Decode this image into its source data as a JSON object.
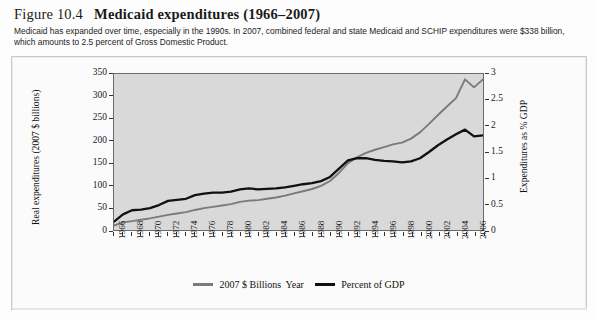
{
  "figure": {
    "number": "Figure 10.4",
    "title": "Medicaid expenditures (1966–2007)",
    "caption": "Medicaid has expanded over time, especially in the 1990s. In 2007, combined federal and state Medicaid and SCHIP expenditures were $338 billion, which amounts to 2.5 percent of Gross Domestic Product."
  },
  "colors": {
    "series_billions": "#7a7a7a",
    "series_gdp": "#111111",
    "plot_background": "#d9d9d9",
    "frame": "#6a6a6a",
    "page_background": "#fdfdfd"
  },
  "chart_data": {
    "type": "line",
    "title": "Medicaid expenditures (1966–2007)",
    "xlabel": "Year",
    "ylabel": "Real expenditures (2007 $ billions)",
    "y2label": "Expenditures as % GDP",
    "xlim": [
      1966,
      2007
    ],
    "ylim": [
      0,
      350
    ],
    "y2lim": [
      0,
      3
    ],
    "yticks": [
      0,
      50,
      100,
      150,
      200,
      250,
      300,
      350
    ],
    "y2ticks": [
      0,
      0.5,
      1,
      1.5,
      2,
      2.5,
      3
    ],
    "xticklabels": [
      "1966",
      "1968",
      "1970",
      "1972",
      "1974",
      "1976",
      "1978",
      "1980",
      "1982",
      "1984",
      "1986",
      "1988",
      "1990",
      "1992",
      "1994",
      "1996",
      "1998",
      "2000",
      "2002",
      "2004",
      "2006"
    ],
    "grid": false,
    "legend_position": "bottom-center",
    "x": [
      1966,
      1967,
      1968,
      1969,
      1970,
      1971,
      1972,
      1973,
      1974,
      1975,
      1976,
      1977,
      1978,
      1979,
      1980,
      1981,
      1982,
      1983,
      1984,
      1985,
      1986,
      1987,
      1988,
      1989,
      1990,
      1991,
      1992,
      1993,
      1994,
      1995,
      1996,
      1997,
      1998,
      1999,
      2000,
      2001,
      2002,
      2003,
      2004,
      2005,
      2006,
      2007
    ],
    "series": [
      {
        "name": "2007 $ Billions",
        "axis": "left",
        "color": "#7a7a7a",
        "values": [
          10,
          17,
          20,
          23,
          26,
          30,
          34,
          37,
          40,
          45,
          49,
          52,
          55,
          58,
          63,
          66,
          67,
          70,
          73,
          77,
          82,
          87,
          92,
          99,
          110,
          128,
          150,
          163,
          173,
          180,
          186,
          192,
          196,
          205,
          219,
          238,
          258,
          277,
          296,
          338,
          320,
          338
        ]
      },
      {
        "name": "Percent of GDP",
        "axis": "right",
        "color": "#111111",
        "values": [
          0.16,
          0.3,
          0.38,
          0.39,
          0.42,
          0.48,
          0.56,
          0.58,
          0.6,
          0.67,
          0.7,
          0.72,
          0.72,
          0.74,
          0.78,
          0.8,
          0.78,
          0.79,
          0.8,
          0.82,
          0.85,
          0.88,
          0.9,
          0.94,
          1.02,
          1.18,
          1.34,
          1.38,
          1.38,
          1.35,
          1.33,
          1.32,
          1.3,
          1.32,
          1.38,
          1.5,
          1.63,
          1.74,
          1.84,
          1.93,
          1.8,
          1.82
        ]
      }
    ]
  },
  "legend": {
    "items": [
      {
        "label": "2007 $ Billions",
        "color": "#7a7a7a"
      },
      {
        "label": "Percent of GDP",
        "color": "#111111"
      }
    ]
  }
}
